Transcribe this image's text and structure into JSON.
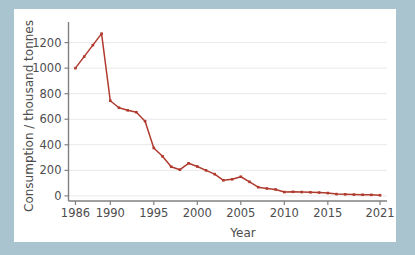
{
  "figure": {
    "background_color": "#a9c4cf",
    "panel_color": "#ffffff",
    "line_color": "#b03a2e",
    "axis_color": "#808080",
    "grid_color": "#e8e8e8",
    "text_color": "#4d4d4d"
  },
  "chart_data": {
    "type": "line",
    "title": "",
    "xlabel": "Year",
    "ylabel": "Consumption / thousand tonnes",
    "xlim": [
      1985.2,
      2021.8
    ],
    "ylim": [
      -40,
      1330
    ],
    "grid": "horizontal",
    "legend": "none",
    "markers": "square",
    "xticks": [
      1986,
      1990,
      1995,
      2000,
      2005,
      2010,
      2015,
      2021
    ],
    "xtick_labels": [
      "1986",
      "1990",
      "1995",
      "2000",
      "2005",
      "2010",
      "2015",
      "2021"
    ],
    "yticks": [
      0,
      200,
      400,
      600,
      800,
      1000,
      1200
    ],
    "ytick_labels": [
      "0",
      "200",
      "400",
      "600",
      "800",
      "1000",
      "1200"
    ],
    "series": [
      {
        "name": "Consumption",
        "color": "#b03a2e",
        "x": [
          1986,
          1987,
          1988,
          1989,
          1990,
          1991,
          1992,
          1993,
          1994,
          1995,
          1996,
          1997,
          1998,
          1999,
          2000,
          2001,
          2002,
          2003,
          2004,
          2005,
          2006,
          2007,
          2008,
          2009,
          2010,
          2011,
          2012,
          2013,
          2014,
          2015,
          2016,
          2017,
          2018,
          2019,
          2020,
          2021
        ],
        "values": [
          1000,
          1090,
          1180,
          1270,
          745,
          690,
          670,
          655,
          585,
          375,
          310,
          228,
          205,
          255,
          230,
          200,
          170,
          122,
          130,
          150,
          110,
          68,
          58,
          50,
          30,
          32,
          30,
          28,
          26,
          22,
          14,
          12,
          10,
          9,
          8,
          5
        ]
      }
    ]
  }
}
